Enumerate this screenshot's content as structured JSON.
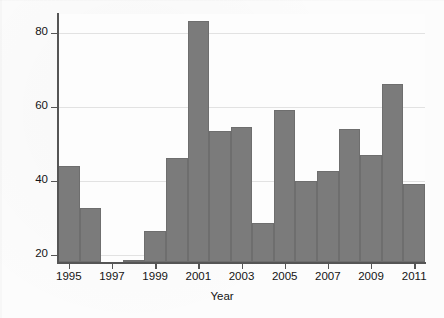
{
  "chart_data": {
    "type": "bar",
    "title": "",
    "xlabel": "Year",
    "ylabel": "Percentage of complainants that are high cost",
    "categories": [
      1995,
      1996,
      1997,
      1998,
      1999,
      2000,
      2001,
      2002,
      2003,
      2004,
      2005,
      2006,
      2007,
      2008,
      2009,
      2010,
      2011
    ],
    "values": [
      44,
      32.5,
      null,
      18.5,
      26.5,
      46,
      83,
      53.5,
      54.5,
      28.5,
      59,
      40,
      42.5,
      54,
      47,
      66,
      39
    ],
    "xlim": [
      1994.5,
      2011.5
    ],
    "ylim": [
      18,
      85
    ],
    "ytick_values": [
      20,
      40,
      60,
      80
    ],
    "ytick_labels": [
      "20",
      "40",
      "60",
      "80"
    ],
    "xtick_values": [
      1995,
      1997,
      1999,
      2001,
      2003,
      2005,
      2007,
      2009,
      2011
    ],
    "xtick_labels": [
      "1995",
      "1997",
      "1999",
      "2001",
      "2003",
      "2005",
      "2007",
      "2009",
      "2011"
    ],
    "grid": true,
    "grid_axis": "y",
    "legend": false,
    "bar_color": "#7b7b7b",
    "bar_edge_color": "#6e6e6e",
    "grid_color": "#e2e2e2",
    "axis_color": "#555555",
    "background_color": "#fdfdfd",
    "missing_categories": [
      1997
    ]
  }
}
